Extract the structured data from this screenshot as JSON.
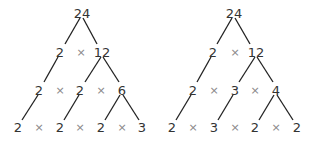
{
  "trees": [
    {
      "root": "24",
      "rows": [
        [
          "2",
          "12"
        ],
        [
          "2",
          "2",
          "6"
        ],
        [
          "2",
          "2",
          "2",
          "3"
        ]
      ]
    },
    {
      "root": "24",
      "rows": [
        [
          "2",
          "12"
        ],
        [
          "2",
          "3",
          "4"
        ],
        [
          "2",
          "3",
          "2",
          "2"
        ]
      ]
    }
  ],
  "operator": "×"
}
